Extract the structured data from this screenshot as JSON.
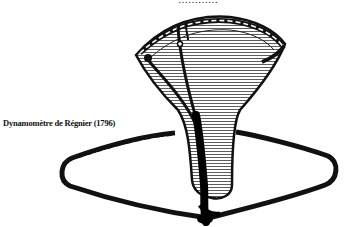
{
  "figure": {
    "top_caption_fragment": "…………",
    "caption": "Dynamomètre de Régnier (1796)"
  }
}
